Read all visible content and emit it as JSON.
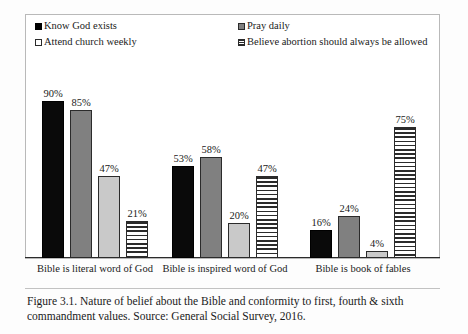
{
  "figure": {
    "caption": "Figure 3.1. Nature of belief about the Bible and conformity to first, fourth & sixth commandment values. Source: General Social Survey, 2016."
  },
  "legend": {
    "items": [
      {
        "label": "Know God exists",
        "swatch": "filled-black-square-icon",
        "color": "#0a0a0a"
      },
      {
        "label": "Pray daily",
        "swatch": "filled-gray-square-icon",
        "color": "#808080"
      },
      {
        "label": "Attend church weekly",
        "swatch": "outlined-light-square-icon",
        "color": "#c9c9c9"
      },
      {
        "label": "Believe abortion should always be allowed",
        "swatch": "horizontal-striped-square-icon",
        "color": "#ffffff"
      }
    ]
  },
  "chart_data": {
    "type": "bar",
    "title": "",
    "subtitle": "",
    "xlabel": "",
    "ylabel": "",
    "ylim": [
      0,
      100
    ],
    "grid": false,
    "legend_position": "top",
    "value_suffix": "%",
    "categories": [
      "Bible is literal word of God",
      "Bible is inspired word of God",
      "Bible is book of fables"
    ],
    "series": [
      {
        "name": "Know God exists",
        "values": [
          90,
          53,
          16
        ],
        "labels": [
          "90%",
          "53%",
          "16%"
        ],
        "color": "#0a0a0a",
        "pattern": "solid-black"
      },
      {
        "name": "Pray daily",
        "values": [
          85,
          58,
          24
        ],
        "labels": [
          "85%",
          "58%",
          "24%"
        ],
        "color": "#808080",
        "pattern": "solid-gray"
      },
      {
        "name": "Attend church weekly",
        "values": [
          47,
          20,
          4
        ],
        "labels": [
          "47%",
          "20%",
          "4%"
        ],
        "color": "#c9c9c9",
        "pattern": "solid-light-gray"
      },
      {
        "name": "Believe abortion should always be allowed",
        "values": [
          21,
          47,
          75
        ],
        "labels": [
          "21%",
          "47%",
          "75%"
        ],
        "color": "#ffffff",
        "pattern": "horizontal-stripes"
      }
    ]
  }
}
